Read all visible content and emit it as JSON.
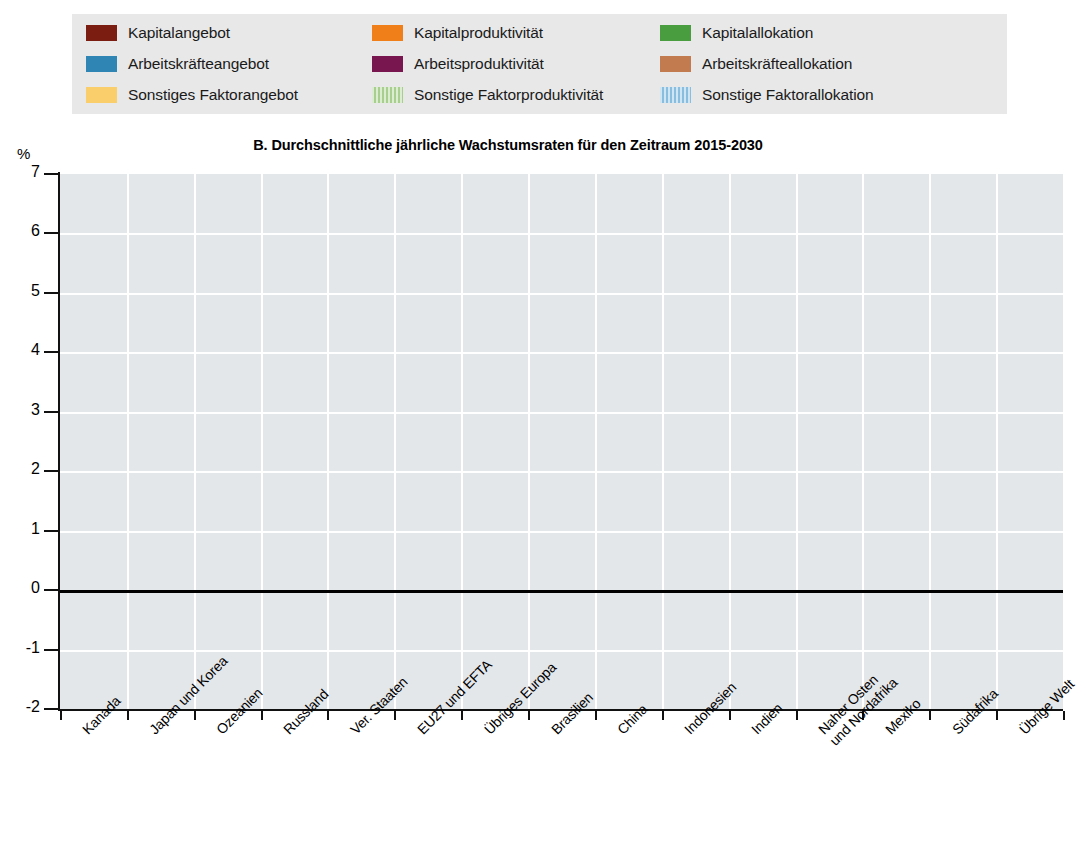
{
  "legend": {
    "items": [
      {
        "label": "Kapitalangebot",
        "color": "#7b1d10",
        "pattern": "solid",
        "key": "kapitalangebot"
      },
      {
        "label": "Kapitalproduktivität",
        "color": "#f07f19",
        "pattern": "solid",
        "key": "kapitalproduktivitaet"
      },
      {
        "label": "Kapitalallokation",
        "color": "#4a9d3f",
        "pattern": "solid",
        "key": "kapitalallokation"
      },
      {
        "label": "Arbeitskräfteangebot",
        "color": "#2f86b5",
        "pattern": "solid",
        "key": "arbeitskraefteangebot"
      },
      {
        "label": "Arbeitsproduktivität",
        "color": "#78174f",
        "pattern": "solid",
        "key": "arbeitsproduktivitaet"
      },
      {
        "label": "Arbeitskräfteallokation",
        "color": "#c27b4e",
        "pattern": "solid",
        "key": "arbeitskraefteallokation"
      },
      {
        "label": "Sonstiges Faktorangebot",
        "color": "#f9ce6b",
        "pattern": "solid",
        "key": "sonstiges_faktorangebot"
      },
      {
        "label": "Sonstige Faktorproduktivität",
        "color": "#a8cf8e",
        "pattern": "hatch",
        "key": "sonstige_faktorproduktivitaet"
      },
      {
        "label": "Sonstige Faktorallokation",
        "color": "#88bfe0",
        "pattern": "hatch",
        "key": "sonstige_faktorallokation"
      }
    ]
  },
  "axis": {
    "unit_label": "%",
    "y_ticks": [
      "7",
      "6",
      "5",
      "4",
      "3",
      "2",
      "1",
      "0",
      "-1",
      "-2"
    ]
  },
  "chart_data": {
    "type": "bar",
    "stacked": true,
    "title": "B.  Durchschnittliche jährliche Wachstumsraten für den Zeitraum 2015-2030",
    "xlabel": "",
    "ylabel": "%",
    "ylim": [
      -2,
      7
    ],
    "ytick_step": 1,
    "grid": true,
    "legend_position": "top",
    "categories": [
      "Kanada",
      "Japan und Korea",
      "Ozeanien",
      "Russland",
      "Ver. Staaten",
      "EU27 und EFTA",
      "Übriges Europa",
      "Brasilien",
      "China",
      "Indonesien",
      "Indien",
      "Naher Osten\nund Nordafrika",
      "Mexiko",
      "Südafrika",
      "Übrige Welt"
    ],
    "series": [
      {
        "name": "Kapitalangebot",
        "color": "#7b1d10",
        "values": [
          0.92,
          0.6,
          1.08,
          1.68,
          0.63,
          0.78,
          1.72,
          1.51,
          4.37,
          1.71,
          3.33,
          2.22,
          2.41,
          1.6,
          2.1
        ]
      },
      {
        "name": "Kapitalproduktivität",
        "color": "#f07f19",
        "values": [
          -0.27,
          0.15,
          -0.33,
          -0.3,
          0.0,
          0.0,
          0.33,
          0.25,
          -0.87,
          0.36,
          0.31,
          0.17,
          0.71,
          0.69,
          0.31
        ]
      },
      {
        "name": "Kapitalallokation",
        "color": "#4a9d3f",
        "values": [
          0.0,
          0.0,
          0.0,
          0.0,
          0.0,
          0.0,
          0.0,
          0.0,
          0.0,
          0.07,
          0.0,
          0.0,
          -0.09,
          0.0,
          0.0
        ]
      },
      {
        "name": "Arbeitskräfteangebot",
        "color": "#2f86b5",
        "values": [
          0.29,
          -0.29,
          0.55,
          -0.12,
          0.67,
          0.1,
          0.45,
          0.5,
          0.0,
          0.13,
          0.73,
          0.63,
          0.6,
          0.55,
          0.67
        ]
      },
      {
        "name": "Arbeitsproduktivität",
        "color": "#78174f",
        "values": [
          0.62,
          1.27,
          0.52,
          1.29,
          1.01,
          0.88,
          1.53,
          1.46,
          1.37,
          1.37,
          2.05,
          0.84,
          0.95,
          1.5,
          1.21
        ]
      },
      {
        "name": "Arbeitskräfteallokation",
        "color": "#c27b4e",
        "values": [
          -0.02,
          -0.01,
          -0.03,
          -0.02,
          -0.04,
          -0.03,
          -0.08,
          -0.07,
          0.0,
          -0.09,
          -0.05,
          -0.05,
          -0.05,
          -0.06,
          -0.05
        ]
      },
      {
        "name": "Sonstiges Faktorangebot",
        "color": "#f9ce6b",
        "values": [
          0.0,
          0.0,
          0.0,
          0.0,
          0.0,
          0.0,
          0.05,
          0.05,
          0.0,
          0.07,
          0.06,
          0.05,
          0.0,
          0.04,
          0.04
        ]
      },
      {
        "name": "Sonstige Faktorproduktivität",
        "color": "#a8cf8e",
        "values": [
          0.0,
          0.0,
          0.0,
          0.0,
          0.0,
          0.0,
          0.0,
          0.0,
          0.0,
          0.0,
          0.0,
          0.0,
          0.0,
          0.0,
          0.0
        ]
      },
      {
        "name": "Sonstige Faktorallokation",
        "color": "#88bfe0",
        "values": [
          0.0,
          0.0,
          0.0,
          0.0,
          0.0,
          0.0,
          0.0,
          0.0,
          0.0,
          0.0,
          0.0,
          0.0,
          0.0,
          0.0,
          0.0
        ]
      }
    ],
    "totals_positive": [
      1.83,
      1.87,
      2.2,
      2.97,
      2.16,
      1.73,
      4.31,
      3.7,
      5.74,
      4.47,
      6.42,
      3.88,
      3.35,
      4.17,
      4.31
    ],
    "totals_negative": [
      -0.29,
      -0.3,
      -0.36,
      -0.44,
      -0.04,
      -0.03,
      -0.08,
      -0.07,
      -0.87,
      -0.09,
      -0.05,
      -0.05,
      -0.14,
      -0.06,
      -0.05
    ]
  }
}
